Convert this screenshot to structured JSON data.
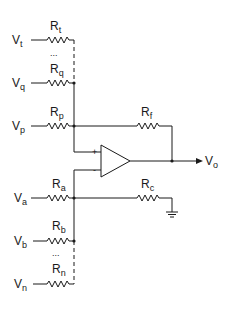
{
  "diagram": {
    "type": "op-amp summing amplifier circuit",
    "inputs_noninverting": [
      {
        "voltage": "V",
        "voltage_sub": "t",
        "resistor": "R",
        "resistor_sub": "t"
      },
      {
        "voltage": "V",
        "voltage_sub": "q",
        "resistor": "R",
        "resistor_sub": "q"
      },
      {
        "voltage": "V",
        "voltage_sub": "p",
        "resistor": "R",
        "resistor_sub": "p"
      }
    ],
    "inputs_inverting": [
      {
        "voltage": "V",
        "voltage_sub": "a",
        "resistor": "R",
        "resistor_sub": "a"
      },
      {
        "voltage": "V",
        "voltage_sub": "b",
        "resistor": "R",
        "resistor_sub": "b"
      },
      {
        "voltage": "V",
        "voltage_sub": "n",
        "resistor": "R",
        "resistor_sub": "n"
      }
    ],
    "feedback": {
      "resistor": "R",
      "resistor_sub": "f"
    },
    "ground_resistor": {
      "resistor": "R",
      "resistor_sub": "c"
    },
    "output": {
      "voltage": "V",
      "voltage_sub": "o"
    },
    "opamp": {
      "plus": "+",
      "minus": "-"
    },
    "ellipsis": "..."
  }
}
